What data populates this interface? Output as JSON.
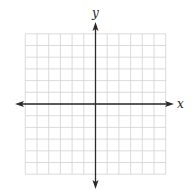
{
  "diagram": {
    "type": "coordinate-plane",
    "x_axis": {
      "label": "x",
      "arrows": "both"
    },
    "y_axis": {
      "label": "y",
      "arrows": "both"
    },
    "grid": {
      "columns_left_of_y_axis": 6,
      "columns_right_of_y_axis": 6,
      "rows_above_x_axis": 6,
      "rows_below_x_axis": 6,
      "tick_labels": false
    },
    "colors": {
      "grid_line": "#d2d2d2",
      "axis": "#2a2a2a",
      "label": "#222222",
      "background": "#ffffff"
    }
  }
}
